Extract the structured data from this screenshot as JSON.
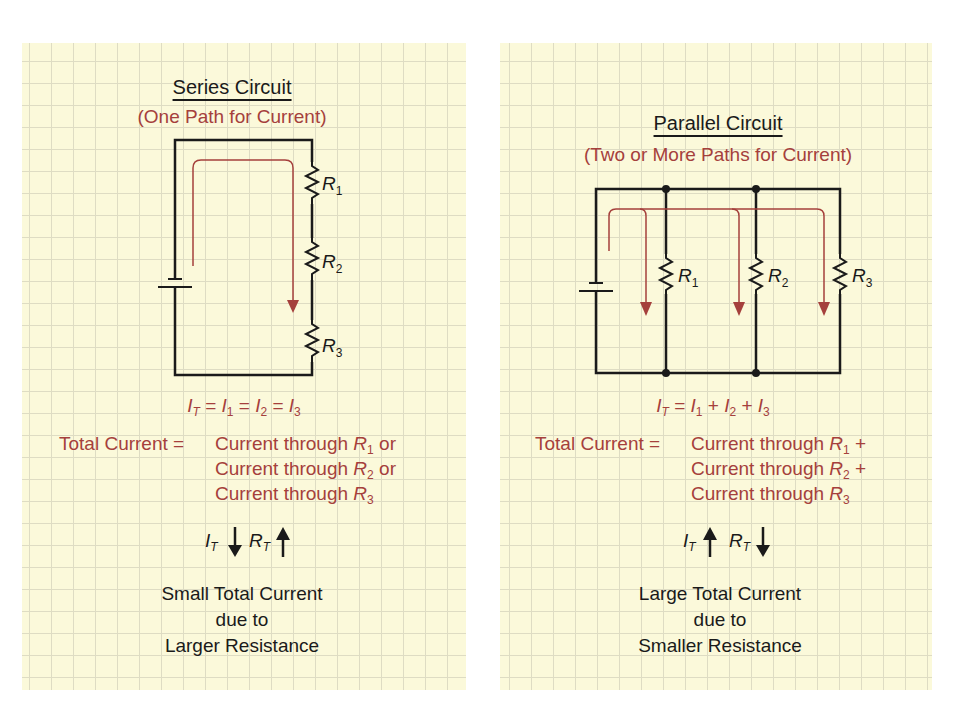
{
  "colors": {
    "paper": "#fbf9da",
    "grid": "#dedcc3",
    "wire": "#1a1a1a",
    "current_path": "#a5403c",
    "accent_text": "#a5403c"
  },
  "series": {
    "title": "Series Circuit",
    "subtitle": "(One Path for Current)",
    "resistors": [
      {
        "label": "R",
        "sub": "1"
      },
      {
        "label": "R",
        "sub": "2"
      },
      {
        "label": "R",
        "sub": "3"
      }
    ],
    "equation": {
      "lhs": "I",
      "lhs_sub": "T",
      "terms": [
        {
          "op": "=",
          "var": "I",
          "sub": "1"
        },
        {
          "op": "=",
          "var": "I",
          "sub": "2"
        },
        {
          "op": "=",
          "var": "I",
          "sub": "3"
        }
      ]
    },
    "description": {
      "lead": "Total Current = ",
      "lines": [
        {
          "text": "Current through ",
          "var": "R",
          "sub": "1",
          "tail": " or"
        },
        {
          "text": "Current through ",
          "var": "R",
          "sub": "2",
          "tail": " or"
        },
        {
          "text": "Current through ",
          "var": "R",
          "sub": "3",
          "tail": ""
        }
      ]
    },
    "trend": {
      "i_var": "I",
      "i_sub": "T",
      "i_direction": "down",
      "r_var": "R",
      "r_sub": "T",
      "r_direction": "up"
    },
    "summary": [
      "Small Total Current",
      "due to",
      "Larger Resistance"
    ]
  },
  "parallel": {
    "title": "Parallel Circuit",
    "subtitle": "(Two or More Paths for Current)",
    "resistors": [
      {
        "label": "R",
        "sub": "1"
      },
      {
        "label": "R",
        "sub": "2"
      },
      {
        "label": "R",
        "sub": "3"
      }
    ],
    "equation": {
      "lhs": "I",
      "lhs_sub": "T",
      "terms": [
        {
          "op": "=",
          "var": "I",
          "sub": "1"
        },
        {
          "op": "+",
          "var": "I",
          "sub": "2"
        },
        {
          "op": "+",
          "var": "I",
          "sub": "3"
        }
      ]
    },
    "description": {
      "lead": "Total Current = ",
      "lines": [
        {
          "text": "Current through ",
          "var": "R",
          "sub": "1",
          "tail": " +"
        },
        {
          "text": "Current through ",
          "var": "R",
          "sub": "2",
          "tail": " +"
        },
        {
          "text": "Current through ",
          "var": "R",
          "sub": "3",
          "tail": ""
        }
      ]
    },
    "trend": {
      "i_var": "I",
      "i_sub": "T",
      "i_direction": "up",
      "r_var": "R",
      "r_sub": "T",
      "r_direction": "down"
    },
    "summary": [
      "Large Total Current",
      "due to",
      "Smaller Resistance"
    ]
  }
}
